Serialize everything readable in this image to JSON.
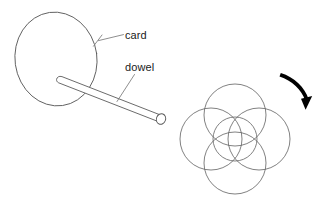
{
  "figure": {
    "background_color": "#ffffff",
    "width": 323,
    "height": 209
  },
  "labels": {
    "card": "card",
    "dowel": "dowel"
  },
  "colors": {
    "outline": "#5a5a5a",
    "circle_outline": "#6a6a6a",
    "leader": "#7a7a7a",
    "arrow": "#000000",
    "text": "#1a1a1a",
    "fill": "#ffffff"
  },
  "icons": {
    "rotation_arrow": "curved-arrow-icon",
    "card_shape": "ellipse-card-icon",
    "dowel_shape": "cylinder-dowel-icon",
    "rosette": "circle-rosette-icon"
  },
  "left_assembly": {
    "card_ellipse": {
      "cx": 56,
      "cy": 59,
      "rx": 41,
      "ry": 47,
      "rotation_deg": -8
    },
    "dowel": {
      "start_x": 62,
      "start_y": 80,
      "end_x": 163,
      "end_y": 119,
      "thickness": 9
    },
    "leader_card": {
      "from_x": 124,
      "from_y": 35,
      "to_x": 95,
      "to_y": 43
    },
    "leader_dowel": {
      "from_x": 135,
      "from_y": 74,
      "to_x": 117,
      "to_y": 101
    }
  },
  "right_assembly": {
    "description": "Rosette of overlapping circles representing the spinning card traces",
    "outer_circle_count": 4,
    "center_circle_count": 1,
    "total_circles": 5,
    "center_x": 235,
    "center_y": 139,
    "outer_radius": 31,
    "outer_offset": 24,
    "center_radius": 22,
    "rotation_arrow": {
      "start_x": 281,
      "start_y": 78,
      "end_x": 307,
      "end_y": 107,
      "direction": "clockwise"
    }
  }
}
